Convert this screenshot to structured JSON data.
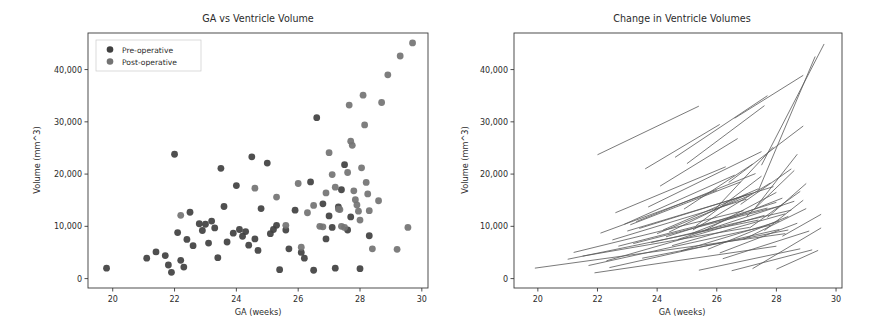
{
  "figure": {
    "background": "#ffffff",
    "panel_count": 2
  },
  "colors": {
    "pre_operative": "#404040",
    "post_operative": "#737373",
    "line": "#5a5a5a",
    "axis": "#3a3a3a",
    "text": "#2b2b2b"
  },
  "left_panel": {
    "title": "GA vs Ventricle Volume",
    "xlabel": "GA (weeks)",
    "ylabel": "Volume (mm^3)",
    "xticks": [
      "20",
      "22",
      "24",
      "26",
      "28",
      "30"
    ],
    "yticks": [
      "0",
      "10,000",
      "20,000",
      "30,000",
      "40,000"
    ],
    "legend": [
      {
        "label": "Pre-operative",
        "marker": "circle",
        "color": "#404040"
      },
      {
        "label": "Post-operative",
        "marker": "circle",
        "color": "#737373"
      }
    ]
  },
  "right_panel": {
    "title": "Change in Ventricle Volumes",
    "xlabel": "GA (weeks)",
    "ylabel": "Volume (mm^3)",
    "xticks": [
      "20",
      "22",
      "24",
      "26",
      "28",
      "30"
    ],
    "yticks": [
      "0",
      "10,000",
      "20,000",
      "30,000",
      "40,000"
    ]
  },
  "chart_data": [
    {
      "type": "scatter",
      "title": "GA vs Ventricle Volume",
      "xlabel": "GA (weeks)",
      "ylabel": "Volume (mm^3)",
      "xlim": [
        19.2,
        30.2
      ],
      "ylim": [
        -1800,
        47000
      ],
      "grid": false,
      "legend_position": "upper left",
      "series": [
        {
          "name": "Pre-operative",
          "color": "#404040",
          "points": [
            [
              19.8,
              2000
            ],
            [
              21.1,
              3900
            ],
            [
              21.4,
              5100
            ],
            [
              21.7,
              4400
            ],
            [
              21.8,
              2600
            ],
            [
              21.9,
              1200
            ],
            [
              22.0,
              23800
            ],
            [
              22.1,
              8800
            ],
            [
              22.2,
              3500
            ],
            [
              22.3,
              2200
            ],
            [
              22.4,
              7500
            ],
            [
              22.5,
              12700
            ],
            [
              22.6,
              6300
            ],
            [
              22.8,
              10500
            ],
            [
              22.9,
              9200
            ],
            [
              23.0,
              10400
            ],
            [
              23.1,
              6800
            ],
            [
              23.2,
              11000
            ],
            [
              23.3,
              9700
            ],
            [
              23.4,
              4000
            ],
            [
              23.5,
              21100
            ],
            [
              23.6,
              13800
            ],
            [
              23.7,
              7000
            ],
            [
              23.9,
              8700
            ],
            [
              24.0,
              17800
            ],
            [
              24.1,
              9400
            ],
            [
              24.2,
              8100
            ],
            [
              24.3,
              9000
            ],
            [
              24.4,
              6400
            ],
            [
              24.5,
              23300
            ],
            [
              24.6,
              7600
            ],
            [
              24.7,
              5400
            ],
            [
              24.8,
              13400
            ],
            [
              25.0,
              22100
            ],
            [
              25.1,
              8600
            ],
            [
              25.2,
              9400
            ],
            [
              25.3,
              10200
            ],
            [
              25.4,
              1700
            ],
            [
              25.6,
              9300
            ],
            [
              25.7,
              5700
            ],
            [
              25.9,
              13100
            ],
            [
              26.1,
              5000
            ],
            [
              26.2,
              3900
            ],
            [
              26.4,
              18500
            ],
            [
              26.5,
              1600
            ],
            [
              26.6,
              30800
            ],
            [
              26.8,
              14300
            ],
            [
              26.9,
              7600
            ],
            [
              27.0,
              12000
            ],
            [
              27.1,
              9800
            ],
            [
              27.2,
              2000
            ],
            [
              27.3,
              13700
            ],
            [
              27.4,
              17000
            ],
            [
              27.5,
              21800
            ],
            [
              27.6,
              9300
            ],
            [
              27.7,
              11800
            ],
            [
              28.0,
              1900
            ],
            [
              28.3,
              8200
            ]
          ]
        },
        {
          "name": "Post-operative",
          "color": "#737373",
          "points": [
            [
              22.2,
              12100
            ],
            [
              24.6,
              17300
            ],
            [
              25.3,
              15600
            ],
            [
              25.6,
              10200
            ],
            [
              26.0,
              18200
            ],
            [
              26.1,
              6000
            ],
            [
              26.3,
              12600
            ],
            [
              26.5,
              14000
            ],
            [
              26.7,
              10000
            ],
            [
              26.8,
              9900
            ],
            [
              26.9,
              16400
            ],
            [
              27.0,
              24100
            ],
            [
              27.1,
              19900
            ],
            [
              27.2,
              17500
            ],
            [
              27.3,
              13300
            ],
            [
              27.35,
              13200
            ],
            [
              27.4,
              10000
            ],
            [
              27.5,
              9800
            ],
            [
              27.6,
              20300
            ],
            [
              27.65,
              33200
            ],
            [
              27.7,
              26300
            ],
            [
              27.75,
              25500
            ],
            [
              27.8,
              16800
            ],
            [
              27.85,
              15100
            ],
            [
              27.9,
              14100
            ],
            [
              27.95,
              12900
            ],
            [
              28.0,
              11200
            ],
            [
              28.05,
              21200
            ],
            [
              28.1,
              35100
            ],
            [
              28.15,
              29400
            ],
            [
              28.2,
              18400
            ],
            [
              28.25,
              16200
            ],
            [
              28.3,
              13000
            ],
            [
              28.4,
              5700
            ],
            [
              28.6,
              14900
            ],
            [
              28.7,
              33700
            ],
            [
              28.9,
              39000
            ],
            [
              29.2,
              5600
            ],
            [
              29.3,
              42600
            ],
            [
              29.55,
              9800
            ],
            [
              29.7,
              45100
            ]
          ]
        }
      ]
    },
    {
      "type": "line",
      "title": "Change in Ventricle Volumes",
      "xlabel": "GA (weeks)",
      "ylabel": "Volume (mm^3)",
      "xlim": [
        19.2,
        30.2
      ],
      "ylim": [
        -1800,
        47000
      ],
      "grid": false,
      "legend_position": "none",
      "description": "Paired segments joining pre-operative to post-operative ventricle volume for each subject",
      "segments": [
        [
          [
            19.9,
            2000
          ],
          [
            28.3,
            8600
          ]
        ],
        [
          [
            21.0,
            3700
          ],
          [
            27.4,
            11200
          ]
        ],
        [
          [
            21.2,
            5000
          ],
          [
            26.9,
            13000
          ]
        ],
        [
          [
            21.5,
            4300
          ],
          [
            27.1,
            9800
          ]
        ],
        [
          [
            21.7,
            2500
          ],
          [
            27.8,
            10200
          ]
        ],
        [
          [
            21.9,
            1100
          ],
          [
            28.0,
            6200
          ]
        ],
        [
          [
            22.0,
            23700
          ],
          [
            25.4,
            33000
          ]
        ],
        [
          [
            22.1,
            8700
          ],
          [
            26.0,
            16900
          ]
        ],
        [
          [
            22.3,
            3400
          ],
          [
            27.6,
            12100
          ]
        ],
        [
          [
            22.4,
            2100
          ],
          [
            28.1,
            9400
          ]
        ],
        [
          [
            22.5,
            7400
          ],
          [
            27.0,
            15200
          ]
        ],
        [
          [
            22.6,
            12600
          ],
          [
            26.3,
            21400
          ]
        ],
        [
          [
            22.7,
            6200
          ],
          [
            27.7,
            13500
          ]
        ],
        [
          [
            22.9,
            10400
          ],
          [
            26.6,
            19800
          ]
        ],
        [
          [
            23.0,
            9100
          ],
          [
            27.2,
            16300
          ]
        ],
        [
          [
            23.1,
            10300
          ],
          [
            26.8,
            18500
          ]
        ],
        [
          [
            23.2,
            6700
          ],
          [
            28.2,
            14000
          ]
        ],
        [
          [
            23.3,
            10900
          ],
          [
            27.3,
            20100
          ]
        ],
        [
          [
            23.4,
            9600
          ],
          [
            27.9,
            17600
          ]
        ],
        [
          [
            23.5,
            3900
          ],
          [
            28.4,
            9300
          ]
        ],
        [
          [
            23.6,
            21000
          ],
          [
            26.1,
            29500
          ]
        ],
        [
          [
            23.7,
            13700
          ],
          [
            27.5,
            24300
          ]
        ],
        [
          [
            23.8,
            6900
          ],
          [
            28.5,
            13100
          ]
        ],
        [
          [
            24.0,
            8600
          ],
          [
            27.1,
            15900
          ]
        ],
        [
          [
            24.1,
            17700
          ],
          [
            26.7,
            26800
          ]
        ],
        [
          [
            24.2,
            9300
          ],
          [
            27.4,
            17200
          ]
        ],
        [
          [
            24.3,
            8000
          ],
          [
            28.0,
            14600
          ]
        ],
        [
          [
            24.4,
            8900
          ],
          [
            27.0,
            16100
          ]
        ],
        [
          [
            24.5,
            6300
          ],
          [
            28.3,
            12400
          ]
        ],
        [
          [
            24.6,
            23200
          ],
          [
            27.7,
            35000
          ]
        ],
        [
          [
            24.7,
            7500
          ],
          [
            28.6,
            14800
          ]
        ],
        [
          [
            24.8,
            5300
          ],
          [
            28.1,
            11000
          ]
        ],
        [
          [
            24.9,
            13300
          ],
          [
            27.2,
            21900
          ]
        ],
        [
          [
            25.0,
            22000
          ],
          [
            27.6,
            33100
          ]
        ],
        [
          [
            25.1,
            8500
          ],
          [
            28.2,
            15400
          ]
        ],
        [
          [
            25.2,
            9300
          ],
          [
            27.8,
            18300
          ]
        ],
        [
          [
            25.3,
            10100
          ],
          [
            27.5,
            19600
          ]
        ],
        [
          [
            25.4,
            1600
          ],
          [
            28.8,
            5700
          ]
        ],
        [
          [
            25.6,
            9200
          ],
          [
            28.0,
            16500
          ]
        ],
        [
          [
            25.7,
            5600
          ],
          [
            28.4,
            11900
          ]
        ],
        [
          [
            25.9,
            13000
          ],
          [
            27.9,
            25200
          ]
        ],
        [
          [
            26.1,
            4900
          ],
          [
            28.7,
            10600
          ]
        ],
        [
          [
            26.2,
            3800
          ],
          [
            29.1,
            9100
          ]
        ],
        [
          [
            26.4,
            18400
          ],
          [
            28.9,
            29200
          ]
        ],
        [
          [
            26.5,
            1500
          ],
          [
            29.2,
            5500
          ]
        ],
        [
          [
            26.6,
            30700
          ],
          [
            28.9,
            38900
          ]
        ],
        [
          [
            26.8,
            14200
          ],
          [
            28.5,
            21000
          ]
        ],
        [
          [
            26.9,
            7500
          ],
          [
            29.0,
            13400
          ]
        ],
        [
          [
            27.0,
            11900
          ],
          [
            28.6,
            20700
          ]
        ],
        [
          [
            27.1,
            9700
          ],
          [
            28.8,
            16700
          ]
        ],
        [
          [
            27.2,
            1900
          ],
          [
            29.5,
            9700
          ]
        ],
        [
          [
            27.3,
            13600
          ],
          [
            28.7,
            23800
          ]
        ],
        [
          [
            27.4,
            16900
          ],
          [
            29.3,
            42500
          ]
        ],
        [
          [
            27.5,
            21700
          ],
          [
            29.6,
            44900
          ]
        ],
        [
          [
            27.6,
            9200
          ],
          [
            28.9,
            15000
          ]
        ],
        [
          [
            27.7,
            11700
          ],
          [
            29.0,
            18200
          ]
        ],
        [
          [
            28.0,
            1800
          ],
          [
            29.4,
            5400
          ]
        ],
        [
          [
            28.2,
            8100
          ],
          [
            29.5,
            12300
          ]
        ]
      ]
    }
  ]
}
